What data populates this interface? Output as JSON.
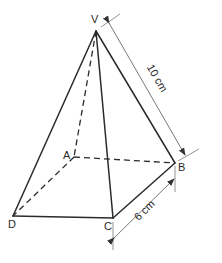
{
  "figure": {
    "vertices": {
      "V": "V",
      "A": "A",
      "B": "B",
      "C": "C",
      "D": "D"
    },
    "visible_edges": [
      "VD",
      "VC",
      "VB",
      "DC",
      "CB"
    ],
    "hidden_edges": [
      "VA",
      "AD",
      "AB"
    ],
    "dimensions": [
      {
        "edge": "VB",
        "label": "10 cm"
      },
      {
        "edge": "CB",
        "label": "6 cm"
      }
    ],
    "colors": {
      "line": "#2b2b2b",
      "dimension": "#555555",
      "background": "#ffffff"
    }
  }
}
